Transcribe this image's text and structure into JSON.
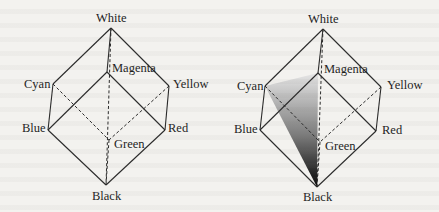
{
  "figure": {
    "background_color": "#f3f2ef",
    "line_color": "#2a2a2a",
    "cubes": [
      {
        "id": "left",
        "shaded_region": null,
        "vertices": {
          "White": {
            "label": "White",
            "x": 111,
            "y": 28
          },
          "Magenta": {
            "label": "Magenta",
            "x": 107,
            "y": 72
          },
          "Cyan": {
            "label": "Cyan",
            "x": 53,
            "y": 84
          },
          "Yellow": {
            "label": "Yellow",
            "x": 169,
            "y": 86
          },
          "Blue": {
            "label": "Blue",
            "x": 48,
            "y": 130
          },
          "Red": {
            "label": "Red",
            "x": 165,
            "y": 130
          },
          "Green": {
            "label": "Green",
            "x": 109,
            "y": 140
          },
          "Black": {
            "label": "Black",
            "x": 106,
            "y": 185
          }
        }
      },
      {
        "id": "right",
        "shaded_region": {
          "shape": "triangle",
          "vertices": [
            "Cyan",
            "Magenta",
            "Black"
          ],
          "gradient": {
            "from": "#e6e6e6",
            "to": "#050505",
            "direction": "top-to-bottom"
          }
        },
        "vertices": {
          "White": {
            "label": "White",
            "x": 323,
            "y": 29
          },
          "Magenta": {
            "label": "Magenta",
            "x": 318,
            "y": 73
          },
          "Cyan": {
            "label": "Cyan",
            "x": 265,
            "y": 86
          },
          "Yellow": {
            "label": "Yellow",
            "x": 381,
            "y": 87
          },
          "Blue": {
            "label": "Blue",
            "x": 260,
            "y": 130
          },
          "Red": {
            "label": "Red",
            "x": 376,
            "y": 131
          },
          "Green": {
            "label": "Green",
            "x": 320,
            "y": 142
          },
          "Black": {
            "label": "Black",
            "x": 317,
            "y": 187
          }
        }
      }
    ],
    "solid_edges": [
      [
        "White",
        "Cyan"
      ],
      [
        "White",
        "Yellow"
      ],
      [
        "White",
        "Magenta"
      ],
      [
        "Cyan",
        "Blue"
      ],
      [
        "Yellow",
        "Red"
      ],
      [
        "Magenta",
        "Blue"
      ],
      [
        "Magenta",
        "Red"
      ],
      [
        "Blue",
        "Black"
      ],
      [
        "Red",
        "Black"
      ]
    ],
    "hidden_edges": [
      [
        "Cyan",
        "Green"
      ],
      [
        "Yellow",
        "Green"
      ],
      [
        "Green",
        "Black"
      ],
      [
        "White",
        "Black"
      ]
    ]
  }
}
